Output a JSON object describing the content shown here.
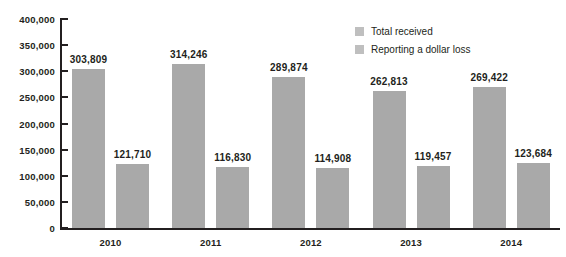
{
  "chart_data": {
    "type": "bar",
    "title": "",
    "xlabel": "",
    "ylabel": "",
    "categories": [
      "2010",
      "2011",
      "2012",
      "2013",
      "2014"
    ],
    "series": [
      {
        "name": "Total received",
        "values": [
          303809,
          314246,
          289874,
          262813,
          269422
        ],
        "labels": [
          "303,809",
          "314,246",
          "289,874",
          "262,813",
          "269,422"
        ],
        "color": "#a9a9a9"
      },
      {
        "name": "Reporting a dollar loss",
        "values": [
          121710,
          116830,
          114908,
          119457,
          123684
        ],
        "labels": [
          "121,710",
          "116,830",
          "114,908",
          "119,457",
          "123,684"
        ],
        "color": "#a9a9a9"
      }
    ],
    "ylim": [
      0,
      400000
    ],
    "ytick_values": [
      0,
      50000,
      100000,
      150000,
      200000,
      250000,
      300000,
      350000,
      400000
    ],
    "ytick_labels": [
      "0",
      "50,000",
      "100,000",
      "150,000",
      "200,000",
      "250,000",
      "300,000",
      "350,000",
      "400,000"
    ],
    "grid": false,
    "legend_position": "top-right"
  },
  "legend": {
    "items": [
      {
        "label": "Total received",
        "swatch_color": "#bfbfbf"
      },
      {
        "label": "Reporting a dollar loss",
        "swatch_color": "#bfbfbf"
      }
    ]
  },
  "footnote": {
    "text": ""
  },
  "colors": {
    "bar": "#a9a9a9",
    "axis": "#231f20",
    "text": "#231f20",
    "background": "#ffffff"
  }
}
